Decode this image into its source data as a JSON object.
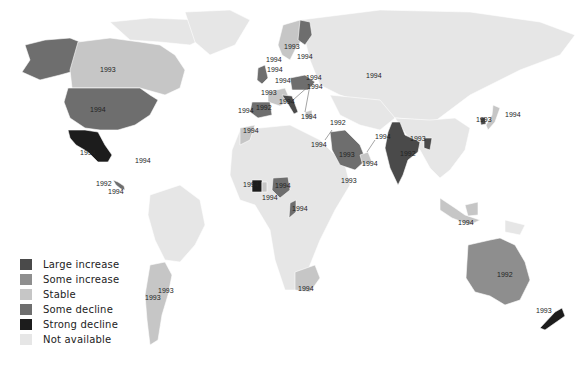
{
  "map": {
    "title": "",
    "colors": {
      "large_increase": "#4a4a4a",
      "some_increase": "#8e8e8e",
      "stable": "#c6c6c6",
      "some_decline": "#6e6e6e",
      "strong_decline": "#1c1c1c",
      "not_available": "#e6e6e6",
      "background": "#ffffff"
    },
    "legend": [
      {
        "key": "large_increase",
        "label": "Large  increase",
        "color": "#4a4a4a"
      },
      {
        "key": "some_increase",
        "label": "Some  increase",
        "color": "#8e8e8e"
      },
      {
        "key": "stable",
        "label": "Stable",
        "color": "#c6c6c6"
      },
      {
        "key": "some_decline",
        "label": "Some  decline",
        "color": "#6e6e6e"
      },
      {
        "key": "strong_decline",
        "label": "Strong  decline",
        "color": "#1c1c1c"
      },
      {
        "key": "not_available",
        "label": "Not available",
        "color": "#e6e6e6"
      }
    ],
    "regions": [
      {
        "name": "Alaska",
        "category": "some_decline"
      },
      {
        "name": "Canada",
        "category": "stable",
        "year": "1993"
      },
      {
        "name": "United States",
        "category": "some_decline",
        "year": "1994"
      },
      {
        "name": "Mexico",
        "category": "strong_decline",
        "year": "1994"
      },
      {
        "name": "Cuba",
        "category": "not_available",
        "year": "1994"
      },
      {
        "name": "Central America (1)",
        "category": "some_decline",
        "year": "1992"
      },
      {
        "name": "Central America (2)",
        "category": "some_decline",
        "year": "1994"
      },
      {
        "name": "Argentina",
        "category": "stable",
        "year": "1993"
      },
      {
        "name": "Uruguay",
        "category": "stable",
        "year": "1993"
      },
      {
        "name": "Norway/Sweden",
        "category": "stable",
        "year": "1994"
      },
      {
        "name": "Finland",
        "category": "some_decline",
        "year": "1993"
      },
      {
        "name": "Finland label 2",
        "category": "some_decline",
        "year": "1994"
      },
      {
        "name": "Denmark",
        "category": "stable",
        "year": "1994"
      },
      {
        "name": "United Kingdom",
        "category": "some_decline",
        "year": "1994"
      },
      {
        "name": "Germany",
        "category": "some_decline",
        "year": "1994"
      },
      {
        "name": "Poland",
        "category": "some_decline",
        "year": "1994"
      },
      {
        "name": "Czech/Hungary",
        "category": "stable",
        "year": "1994"
      },
      {
        "name": "France",
        "category": "stable",
        "year": "1993"
      },
      {
        "name": "Spain",
        "category": "some_decline",
        "year": "1992"
      },
      {
        "name": "Portugal",
        "category": "some_decline",
        "year": "1994"
      },
      {
        "name": "Italy",
        "category": "large_increase",
        "year": "1994"
      },
      {
        "name": "Greece",
        "category": "stable",
        "year": "1994"
      },
      {
        "name": "Morocco",
        "category": "stable",
        "year": "1994"
      },
      {
        "name": "Israel",
        "category": "stable",
        "year": "1992"
      },
      {
        "name": "Egypt",
        "category": "stable",
        "year": "1994"
      },
      {
        "name": "Saudi Arabia",
        "category": "some_decline",
        "year": "1993"
      },
      {
        "name": "Kuwait",
        "category": "stable",
        "year": "1994"
      },
      {
        "name": "UAE/Oman",
        "category": "stable",
        "year": "1994"
      },
      {
        "name": "Ethiopia",
        "category": "not_available",
        "year": "1993"
      },
      {
        "name": "Côte d'Ivoire",
        "category": "strong_decline",
        "year": "1994"
      },
      {
        "name": "Ghana",
        "category": "stable",
        "year": "1994"
      },
      {
        "name": "Nigeria",
        "category": "some_decline",
        "year": "1994"
      },
      {
        "name": "Congo",
        "category": "some_decline",
        "year": "1994"
      },
      {
        "name": "South Africa",
        "category": "stable",
        "year": "1994"
      },
      {
        "name": "Turkey/Caucasus",
        "category": "stable",
        "year": "1994"
      },
      {
        "name": "India",
        "category": "large_increase",
        "year": "1992"
      },
      {
        "name": "Bangladesh",
        "category": "large_increase",
        "year": "1993"
      },
      {
        "name": "Korea",
        "category": "large_increase",
        "year": "1993"
      },
      {
        "name": "Japan",
        "category": "stable",
        "year": "1994"
      },
      {
        "name": "Indonesia",
        "category": "stable",
        "year": "1994"
      },
      {
        "name": "Australia",
        "category": "some_increase",
        "year": "1992"
      },
      {
        "name": "New Zealand",
        "category": "strong_decline",
        "year": "1993"
      }
    ]
  }
}
